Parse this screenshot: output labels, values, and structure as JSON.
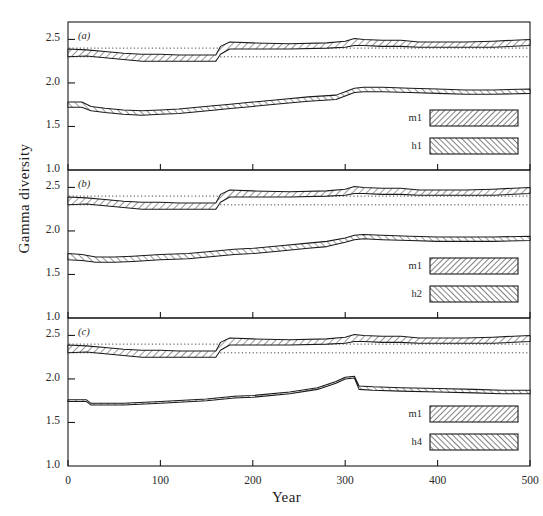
{
  "figure": {
    "ylabel": "Gamma diversity",
    "xlabel": "Year",
    "panels": [
      {
        "id": "(a)",
        "legend": [
          {
            "label": "m1",
            "hatch": "forward"
          },
          {
            "label": "h1",
            "hatch": "backward"
          }
        ]
      },
      {
        "id": "(b)",
        "legend": [
          {
            "label": "m1",
            "hatch": "forward"
          },
          {
            "label": "h2",
            "hatch": "backward"
          }
        ]
      },
      {
        "id": "(c)",
        "legend": [
          {
            "label": "m1",
            "hatch": "forward"
          },
          {
            "label": "h4",
            "hatch": "backward"
          }
        ]
      }
    ],
    "yticks": [
      "1.0",
      "1.5",
      "2.0",
      "2.5"
    ],
    "xticks": [
      "0",
      "100",
      "200",
      "300",
      "400",
      "500"
    ]
  },
  "chart_data": {
    "type": "line",
    "title": "",
    "xlabel": "Year",
    "ylabel": "Gamma diversity",
    "xlim": [
      0,
      500
    ],
    "ylim": [
      1.0,
      2.7
    ],
    "grid": false,
    "legend_position": "inside-bottom-right",
    "panels": [
      {
        "id": "(a)",
        "yticks": [
          1.0,
          1.5,
          2.0,
          2.5
        ],
        "xticks": [
          0,
          100,
          200,
          300,
          400,
          500
        ],
        "reference_lines": [
          {
            "name": "upper-dotted",
            "y": 2.4,
            "style": "dotted"
          },
          {
            "name": "lower-dotted",
            "y": 2.3,
            "style": "dotted"
          }
        ],
        "series": [
          {
            "name": "m1",
            "hatch": "forward",
            "x": [
              0,
              20,
              40,
              60,
              80,
              100,
              120,
              140,
              160,
              165,
              175,
              200,
              240,
              280,
              300,
              310,
              320,
              340,
              360,
              380,
              400,
              430,
              460,
              500
            ],
            "upper": [
              2.39,
              2.38,
              2.36,
              2.34,
              2.33,
              2.33,
              2.32,
              2.32,
              2.32,
              2.42,
              2.47,
              2.46,
              2.45,
              2.46,
              2.48,
              2.51,
              2.5,
              2.49,
              2.49,
              2.47,
              2.47,
              2.47,
              2.48,
              2.5
            ],
            "lower": [
              2.3,
              2.31,
              2.29,
              2.27,
              2.25,
              2.25,
              2.25,
              2.25,
              2.25,
              2.33,
              2.39,
              2.39,
              2.39,
              2.4,
              2.41,
              2.43,
              2.43,
              2.42,
              2.42,
              2.41,
              2.41,
              2.41,
              2.41,
              2.43
            ]
          },
          {
            "name": "h1",
            "hatch": "backward",
            "x": [
              0,
              15,
              25,
              40,
              60,
              80,
              100,
              120,
              140,
              160,
              170,
              200,
              230,
              260,
              290,
              300,
              310,
              320,
              340,
              370,
              400,
              430,
              460,
              500
            ],
            "upper": [
              1.78,
              1.78,
              1.73,
              1.71,
              1.69,
              1.68,
              1.69,
              1.7,
              1.72,
              1.74,
              1.75,
              1.78,
              1.81,
              1.84,
              1.86,
              1.9,
              1.94,
              1.95,
              1.95,
              1.94,
              1.93,
              1.92,
              1.92,
              1.93
            ],
            "lower": [
              1.72,
              1.72,
              1.68,
              1.66,
              1.64,
              1.63,
              1.64,
              1.65,
              1.67,
              1.69,
              1.7,
              1.73,
              1.76,
              1.79,
              1.81,
              1.85,
              1.89,
              1.9,
              1.9,
              1.89,
              1.88,
              1.87,
              1.87,
              1.88
            ]
          }
        ]
      },
      {
        "id": "(b)",
        "yticks": [
          1.0,
          1.5,
          2.0,
          2.5
        ],
        "xticks": [
          0,
          100,
          200,
          300,
          400,
          500
        ],
        "reference_lines": [
          {
            "name": "upper-dotted",
            "y": 2.4,
            "style": "dotted"
          },
          {
            "name": "lower-dotted",
            "y": 2.3,
            "style": "dotted"
          }
        ],
        "series": [
          {
            "name": "m1",
            "hatch": "forward",
            "x": [
              0,
              20,
              40,
              60,
              80,
              100,
              120,
              140,
              160,
              165,
              175,
              200,
              240,
              280,
              300,
              310,
              320,
              340,
              360,
              380,
              400,
              430,
              460,
              500
            ],
            "upper": [
              2.39,
              2.38,
              2.36,
              2.34,
              2.33,
              2.33,
              2.32,
              2.32,
              2.32,
              2.42,
              2.47,
              2.46,
              2.45,
              2.46,
              2.48,
              2.51,
              2.5,
              2.49,
              2.49,
              2.47,
              2.47,
              2.47,
              2.48,
              2.5
            ],
            "lower": [
              2.3,
              2.31,
              2.29,
              2.27,
              2.25,
              2.25,
              2.25,
              2.25,
              2.25,
              2.33,
              2.39,
              2.39,
              2.39,
              2.4,
              2.41,
              2.43,
              2.43,
              2.42,
              2.42,
              2.41,
              2.41,
              2.41,
              2.41,
              2.43
            ]
          },
          {
            "name": "h2",
            "hatch": "backward",
            "x": [
              0,
              15,
              30,
              50,
              70,
              100,
              130,
              160,
              180,
              200,
              230,
              260,
              280,
              300,
              310,
              320,
              340,
              370,
              400,
              430,
              460,
              500
            ],
            "upper": [
              1.74,
              1.73,
              1.7,
              1.7,
              1.71,
              1.73,
              1.74,
              1.77,
              1.79,
              1.8,
              1.83,
              1.86,
              1.88,
              1.92,
              1.95,
              1.96,
              1.95,
              1.94,
              1.93,
              1.93,
              1.93,
              1.94
            ],
            "lower": [
              1.67,
              1.66,
              1.64,
              1.64,
              1.65,
              1.67,
              1.68,
              1.71,
              1.73,
              1.74,
              1.77,
              1.8,
              1.82,
              1.87,
              1.9,
              1.91,
              1.9,
              1.89,
              1.88,
              1.88,
              1.88,
              1.89
            ]
          }
        ]
      },
      {
        "id": "(c)",
        "yticks": [
          1.0,
          1.5,
          2.0,
          2.5
        ],
        "xticks": [
          0,
          100,
          200,
          300,
          400,
          500
        ],
        "reference_lines": [
          {
            "name": "upper-dotted",
            "y": 2.4,
            "style": "dotted"
          },
          {
            "name": "lower-dotted",
            "y": 2.3,
            "style": "dotted"
          }
        ],
        "series": [
          {
            "name": "m1",
            "hatch": "forward",
            "x": [
              0,
              20,
              40,
              60,
              80,
              100,
              120,
              140,
              160,
              165,
              175,
              200,
              240,
              280,
              300,
              310,
              320,
              340,
              360,
              380,
              400,
              430,
              460,
              500
            ],
            "upper": [
              2.39,
              2.38,
              2.36,
              2.34,
              2.33,
              2.33,
              2.32,
              2.32,
              2.32,
              2.42,
              2.47,
              2.46,
              2.45,
              2.46,
              2.48,
              2.51,
              2.5,
              2.49,
              2.49,
              2.47,
              2.47,
              2.47,
              2.48,
              2.5
            ],
            "lower": [
              2.3,
              2.31,
              2.29,
              2.27,
              2.25,
              2.25,
              2.25,
              2.25,
              2.25,
              2.33,
              2.39,
              2.39,
              2.39,
              2.4,
              2.41,
              2.43,
              2.43,
              2.42,
              2.42,
              2.41,
              2.41,
              2.41,
              2.41,
              2.43
            ]
          },
          {
            "name": "h4",
            "hatch": "backward",
            "x": [
              0,
              20,
              25,
              60,
              100,
              150,
              180,
              200,
              240,
              270,
              290,
              300,
              310,
              315,
              330,
              360,
              400,
              440,
              470,
              500
            ],
            "upper": [
              1.76,
              1.76,
              1.72,
              1.72,
              1.74,
              1.77,
              1.8,
              1.81,
              1.85,
              1.9,
              1.97,
              2.02,
              2.03,
              1.92,
              1.91,
              1.9,
              1.89,
              1.88,
              1.87,
              1.87
            ],
            "lower": [
              1.74,
              1.74,
              1.7,
              1.7,
              1.72,
              1.75,
              1.78,
              1.79,
              1.83,
              1.88,
              1.95,
              2.0,
              2.01,
              1.88,
              1.87,
              1.86,
              1.85,
              1.84,
              1.83,
              1.83
            ]
          }
        ]
      }
    ]
  }
}
